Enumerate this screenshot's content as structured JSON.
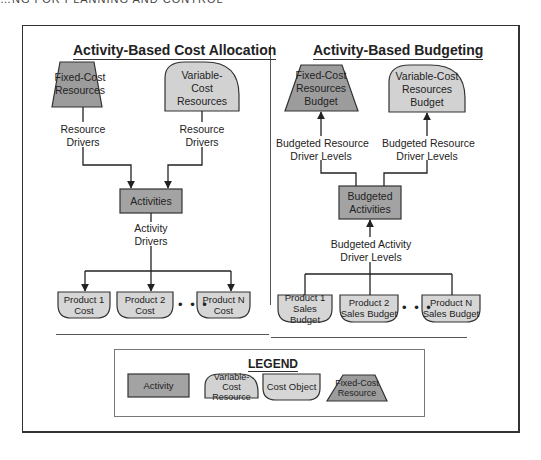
{
  "header": {
    "clipped_text": "…NG FOR PLANNING AND CONTROL"
  },
  "colors": {
    "activity_fill": "#a3a3a3",
    "fixed_cost_fill": "#9c9c9c",
    "variable_cost_fill": "#d2d2d2",
    "cost_object_fill": "#d6d6d6",
    "stroke": "#333333"
  },
  "left_panel": {
    "title": "Activity-Based Cost Allocation",
    "fixed_cost": {
      "line1": "Fixed-Cost",
      "line2": "Resources"
    },
    "variable_cost": {
      "line1": "Variable-",
      "line2": "Cost",
      "line3": "Resources"
    },
    "resource_drivers_left": {
      "line1": "Resource",
      "line2": "Drivers"
    },
    "resource_drivers_right": {
      "line1": "Resource",
      "line2": "Drivers"
    },
    "activities": "Activities",
    "activity_drivers": {
      "line1": "Activity",
      "line2": "Drivers"
    },
    "products": [
      {
        "line1": "Product 1",
        "line2": "Cost"
      },
      {
        "line1": "Product 2",
        "line2": "Cost"
      },
      {
        "line1": "Product N",
        "line2": "Cost"
      }
    ],
    "ellipsis": "• • •"
  },
  "right_panel": {
    "title": "Activity-Based Budgeting",
    "fixed_cost": {
      "line1": "Fixed-Cost",
      "line2": "Resources",
      "line3": "Budget"
    },
    "variable_cost": {
      "line1": "Variable-Cost",
      "line2": "Resources",
      "line3": "Budget"
    },
    "resource_levels_left": {
      "line1": "Budgeted Resource",
      "line2": "Driver Levels"
    },
    "resource_levels_right": {
      "line1": "Budgeted Resource",
      "line2": "Driver Levels"
    },
    "activities": {
      "line1": "Budgeted",
      "line2": "Activities"
    },
    "activity_levels": {
      "line1": "Budgeted Activity",
      "line2": "Driver Levels"
    },
    "products": [
      {
        "line1": "Product 1",
        "line2": "Sales Budget"
      },
      {
        "line1": "Product 2",
        "line2": "Sales Budget"
      },
      {
        "line1": "Product N",
        "line2": "Sales Budget"
      }
    ],
    "ellipsis": "• • •"
  },
  "legend": {
    "title": "LEGEND",
    "items": [
      {
        "line1": "Activity",
        "line2": ""
      },
      {
        "line1": "Variable-Cost",
        "line2": "Resource"
      },
      {
        "line1": "Cost Object",
        "line2": ""
      },
      {
        "line1": "Fixed-Cost",
        "line2": "Resource"
      }
    ]
  }
}
